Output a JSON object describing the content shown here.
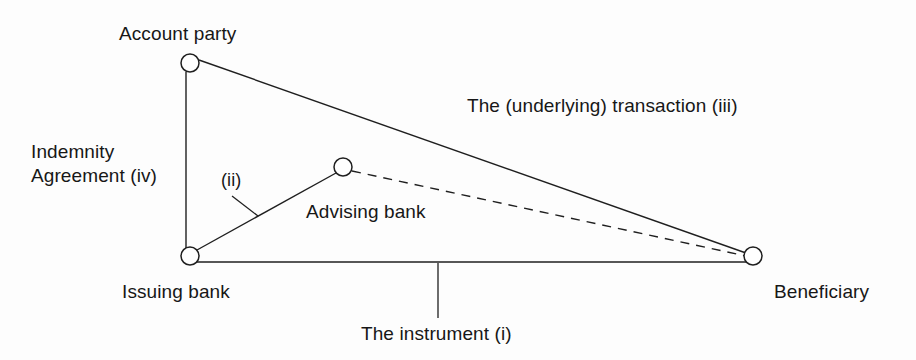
{
  "diagram": {
    "type": "node-link-triangle",
    "background_color": "#fdfdfd",
    "line_color": "#1f1f1f",
    "text_color": "#171717",
    "nodes": [
      {
        "id": "account-party",
        "label": "Account party",
        "x": 190,
        "y": 63,
        "radius": 9
      },
      {
        "id": "issuing-bank",
        "label": "Issuing bank",
        "x": 190,
        "y": 256,
        "radius": 9
      },
      {
        "id": "advising-bank",
        "label": "Advising bank",
        "x": 343,
        "y": 167,
        "radius": 9
      },
      {
        "id": "beneficiary",
        "label": "Beneficiary",
        "x": 753,
        "y": 256,
        "radius": 9
      }
    ],
    "edges": [
      {
        "id": "edge-indemnity",
        "from": "account-party",
        "to": "issuing-bank",
        "style": "solid",
        "label": "Indemnity\nAgreement (iv)"
      },
      {
        "id": "edge-transaction",
        "from": "account-party",
        "to": "beneficiary",
        "style": "solid",
        "label": "The (underlying) transaction (iii)"
      },
      {
        "id": "edge-instrument",
        "from": "issuing-bank",
        "to": "beneficiary",
        "style": "solid",
        "label": "The instrument (i)"
      },
      {
        "id": "edge-advice",
        "from": "issuing-bank",
        "to": "advising-bank",
        "style": "solid",
        "label": "(ii)"
      },
      {
        "id": "edge-confirmation",
        "from": "advising-bank",
        "to": "beneficiary",
        "style": "dashed",
        "label": ""
      }
    ],
    "labels": {
      "account_party": "Account party",
      "transaction": "The (underlying) transaction (iii)",
      "indemnity": "Indemnity\nAgreement (iv)",
      "roman_ii": "(ii)",
      "advising_bank": "Advising bank",
      "issuing_bank": "Issuing bank",
      "beneficiary": "Beneficiary",
      "instrument": "The instrument (i)"
    }
  }
}
